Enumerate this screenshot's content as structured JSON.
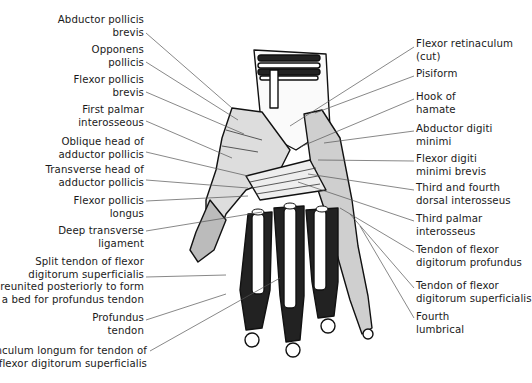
{
  "figure": {
    "labels_left": [
      {
        "id": "abductor-pollicis-brevis",
        "lines": [
          "Abductor pollicis",
          "brevis"
        ],
        "x": 144,
        "y": 14,
        "anchor": [
          146,
          33
        ],
        "target": [
          232,
          108
        ]
      },
      {
        "id": "opponens-pollicis",
        "lines": [
          "Opponens",
          "pollicis"
        ],
        "x": 144,
        "y": 44,
        "anchor": [
          146,
          62
        ],
        "target": [
          238,
          120
        ]
      },
      {
        "id": "flexor-pollicis-brevis",
        "lines": [
          "Flexor pollicis",
          "brevis"
        ],
        "x": 144,
        "y": 74,
        "anchor": [
          146,
          92
        ],
        "target": [
          244,
          134
        ]
      },
      {
        "id": "first-palmar-interosseous",
        "lines": [
          "First palmar",
          "interosseous"
        ],
        "x": 144,
        "y": 104,
        "anchor": [
          146,
          121
        ],
        "target": [
          232,
          158
        ]
      },
      {
        "id": "oblique-head-adductor-pollicis",
        "lines": [
          "Oblique head of",
          "adductor pollicis"
        ],
        "x": 144,
        "y": 136,
        "anchor": [
          146,
          152
        ],
        "target": [
          248,
          176
        ]
      },
      {
        "id": "transverse-head-adductor-pollicis",
        "lines": [
          "Transverse head of",
          "adductor pollicis"
        ],
        "x": 144,
        "y": 164,
        "anchor": [
          146,
          180
        ],
        "target": [
          248,
          188
        ]
      },
      {
        "id": "flexor-pollicis-longus",
        "lines": [
          "Flexor pollicis",
          "longus"
        ],
        "x": 144,
        "y": 195,
        "anchor": [
          146,
          201
        ],
        "target": [
          248,
          196
        ]
      },
      {
        "id": "deep-transverse-ligament",
        "lines": [
          "Deep transverse",
          "ligament"
        ],
        "x": 144,
        "y": 225,
        "anchor": [
          146,
          231
        ],
        "target": [
          262,
          212
        ]
      },
      {
        "id": "split-tendon-fds",
        "lines": [
          "Split tendon of flexor",
          "digitorum superficialis",
          "reunited  posteriorly to form",
          "a bed for profundus tendon"
        ],
        "x": 144,
        "y": 256,
        "anchor": [
          146,
          277
        ],
        "target": [
          226,
          275
        ]
      },
      {
        "id": "profundus-tendon",
        "lines": [
          "Profundus",
          "tendon"
        ],
        "x": 144,
        "y": 312,
        "anchor": [
          146,
          320
        ],
        "target": [
          226,
          294
        ]
      },
      {
        "id": "vinculum-longum",
        "lines": [
          "Vinculum longum for tendon of",
          "flexor digitorum superficialis"
        ],
        "x": 147,
        "y": 345,
        "anchor": [
          150,
          351
        ],
        "target": [
          280,
          278
        ]
      }
    ],
    "labels_right": [
      {
        "id": "flexor-retinaculum-cut",
        "lines": [
          "Flexor retinaculum",
          "(cut)"
        ],
        "x": 416,
        "y": 38,
        "anchor": [
          414,
          47
        ],
        "target": [
          290,
          126
        ]
      },
      {
        "id": "pisiform",
        "lines": [
          "Pisiform"
        ],
        "x": 416,
        "y": 68,
        "anchor": [
          414,
          76
        ],
        "target": [
          315,
          113
        ]
      },
      {
        "id": "hook-of-hamate",
        "lines": [
          "Hook of",
          "hamate"
        ],
        "x": 416,
        "y": 91,
        "anchor": [
          414,
          99
        ],
        "target": [
          300,
          147
        ]
      },
      {
        "id": "abductor-digiti-minimi",
        "lines": [
          "Abductor digiti",
          "minimi"
        ],
        "x": 416,
        "y": 123,
        "anchor": [
          414,
          131
        ],
        "target": [
          324,
          143
        ]
      },
      {
        "id": "flexor-digiti-minimi-brevis",
        "lines": [
          "Flexor digiti",
          "minimi brevis"
        ],
        "x": 416,
        "y": 153,
        "anchor": [
          414,
          161
        ],
        "target": [
          318,
          160
        ]
      },
      {
        "id": "third-fourth-dorsal-interosseus",
        "lines": [
          "Third and fourth",
          "dorsal interosseus"
        ],
        "x": 416,
        "y": 182,
        "anchor": [
          414,
          190
        ],
        "target": [
          308,
          174
        ]
      },
      {
        "id": "third-palmar-interosseus",
        "lines": [
          "Third palmar",
          "interosseus"
        ],
        "x": 416,
        "y": 213,
        "anchor": [
          414,
          221
        ],
        "target": [
          298,
          182
        ]
      },
      {
        "id": "tendon-fdp",
        "lines": [
          "Tendon of flexor",
          "digitorum profundus"
        ],
        "x": 416,
        "y": 244,
        "anchor": [
          414,
          252
        ],
        "target": [
          340,
          208
        ]
      },
      {
        "id": "tendon-fds",
        "lines": [
          "Tendon of flexor",
          "digitorum superficialis"
        ],
        "x": 416,
        "y": 280,
        "anchor": [
          414,
          288
        ],
        "target": [
          350,
          214
        ]
      },
      {
        "id": "fourth-lumbrical",
        "lines": [
          "Fourth",
          "lumbrical"
        ],
        "x": 416,
        "y": 311,
        "anchor": [
          414,
          318
        ],
        "target": [
          360,
          226
        ]
      }
    ],
    "colors": {
      "ink": "#111111",
      "leader": "#555555",
      "paper": "#ffffff",
      "shade": "#2a2a2a"
    }
  }
}
